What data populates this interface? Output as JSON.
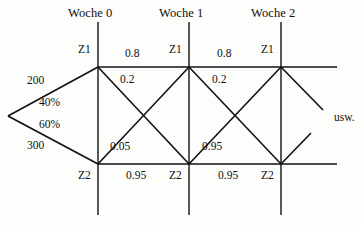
{
  "figure": {
    "kind": "markov-chain-trellis-diagram",
    "continuation_label": "usw."
  },
  "columns": [
    {
      "title": "Woche 0",
      "state_top": "Z1",
      "state_bottom": "Z2"
    },
    {
      "title": "Woche 1",
      "state_top": "Z1",
      "state_bottom": "Z2"
    },
    {
      "title": "Woche 2",
      "state_top": "Z1",
      "state_bottom": "Z2"
    }
  ],
  "inputs": {
    "top_count": "200",
    "top_share": "40%",
    "bottom_share": "60%",
    "bottom_count": "300"
  },
  "transitions": [
    {
      "step": "0-to-1",
      "stay_top": "0.8",
      "top_to_bottom": "0.2",
      "bottom_to_top": "0.05",
      "stay_bottom": "0.95"
    },
    {
      "step": "1-to-2",
      "stay_top": "0.8",
      "top_to_bottom": "0.2",
      "bottom_to_top": "0.05",
      "stay_bottom": "0.95"
    }
  ],
  "colors": {
    "stroke": "#111111",
    "text": "#101010",
    "background": "#fdfdfb"
  }
}
